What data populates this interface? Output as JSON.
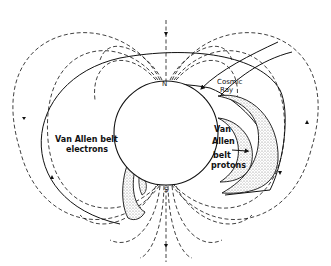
{
  "diagram": {
    "labels": {
      "north": "N",
      "south": "S",
      "cosmic_ray_line1": "Cosmic",
      "cosmic_ray_line2": "Ray",
      "electrons_line1": "Van Allen belt",
      "electrons_line2": "electrons",
      "protons_line1": "Van",
      "protons_line2": "Allen",
      "protons_line3": "belt",
      "protons_line4": "protons"
    },
    "colors": {
      "line": "#111111",
      "background": "#ffffff",
      "stipple": "#9a9a9a"
    }
  }
}
